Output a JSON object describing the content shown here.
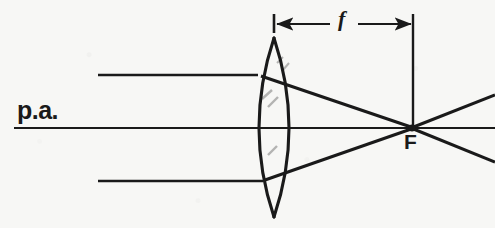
{
  "figure": {
    "type": "optics-ray-diagram",
    "width": 495,
    "height": 228,
    "background_color": "#f7f7f5",
    "ink_color": "#1a1a1a"
  },
  "labels": {
    "principal_axis": "p.a.",
    "focal_point": "F",
    "focal_length": "f"
  },
  "geometry": {
    "principal_axis": {
      "x1": 14,
      "y1": 128,
      "x2": 495,
      "y2": 128
    },
    "lens": {
      "top_apex": {
        "x": 274,
        "y": 38
      },
      "bottom_apex": {
        "x": 274,
        "y": 217
      },
      "left_surface_vertex": {
        "x": 250,
        "y": 128
      },
      "right_surface_vertex": {
        "x": 297,
        "y": 128
      },
      "center": {
        "x": 274,
        "y": 128
      }
    },
    "focal_point": {
      "x": 412,
      "y": 128
    },
    "focal_length_dimension": {
      "y": 24,
      "left_tick_x": 274,
      "right_tick_x": 413,
      "left_tick_top": 14,
      "left_tick_bottom": 33,
      "extension_line_top": 14,
      "extension_line_bottom": 128
    },
    "incoming_rays": [
      {
        "name": "upper",
        "x1": 98,
        "y": 75,
        "x2": 258,
        "arrow_x": 176
      },
      {
        "name": "lower",
        "x1": 98,
        "y": 181,
        "x2": 262,
        "arrow_x": 176
      }
    ],
    "refracted_rays": [
      {
        "name": "upper",
        "x1": 262,
        "y1": 77,
        "x2": 412,
        "y2": 128
      },
      {
        "name": "lower",
        "x1": 266,
        "y1": 180,
        "x2": 412,
        "y2": 128
      }
    ],
    "diverging_rays": [
      {
        "name": "upper",
        "x1": 412,
        "y1": 128,
        "x2": 495,
        "y2": 96
      },
      {
        "name": "lower",
        "x1": 412,
        "y1": 128,
        "x2": 495,
        "y2": 161
      }
    ]
  }
}
